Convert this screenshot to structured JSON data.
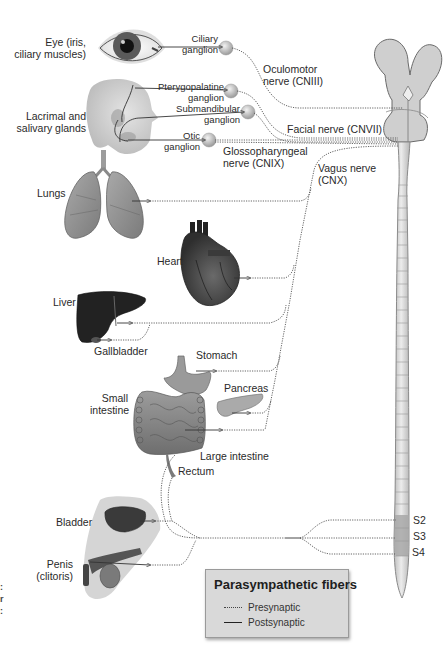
{
  "title": "Parasympathetic fibers",
  "legend": {
    "title": "Parasympathetic fibers",
    "items": [
      {
        "style": "dotted",
        "label": "Presynaptic"
      },
      {
        "style": "solid",
        "label": "Postsynaptic"
      }
    ]
  },
  "organs": {
    "eye": "Eye (iris,\nciliary muscles)",
    "eye_l1": "Eye (iris,",
    "eye_l2": "ciliary muscles)",
    "glands_l1": "Lacrimal and",
    "glands_l2": "salivary glands",
    "lungs": "Lungs",
    "heart": "Heart",
    "liver": "Liver",
    "gallbladder": "Gallbladder",
    "stomach": "Stomach",
    "pancreas": "Pancreas",
    "small_intestine_l1": "Small",
    "small_intestine_l2": "intestine",
    "large_intestine": "Large intestine",
    "rectum": "Rectum",
    "bladder": "Bladder",
    "penis_l1": "Penis",
    "penis_l2": "(clitoris)"
  },
  "ganglia": {
    "ciliary_l1": "Ciliary",
    "ciliary_l2": "ganglion",
    "pterygopalatine_l1": "Pterygopalatine",
    "pterygopalatine_l2": "ganglion",
    "submandibular_l1": "Submandibular",
    "submandibular_l2": "ganglion",
    "otic_l1": "Otic",
    "otic_l2": "ganglion"
  },
  "nerves": {
    "oculomotor_l1": "Oculomotor",
    "oculomotor_l2": "nerve (CNIII)",
    "facial": "Facial nerve (CNVII)",
    "glosso_l1": "Glossopharyngeal",
    "glosso_l2": "nerve (CNIX)",
    "vagus_l1": "Vagus nerve",
    "vagus_l2": "(CNX)"
  },
  "spinal_segments": [
    "S2",
    "S3",
    "S4"
  ],
  "edge_marks": [
    ":",
    "r",
    ":"
  ],
  "colors": {
    "background": "#ffffff",
    "legend_bg": "#d9d9d9",
    "organ_gray": "#8c8c8c",
    "dark_organ": "#2b2b2b",
    "cord": "#dcdcdc",
    "sacral_band": "#a8a8a8",
    "fiber": "#555555"
  }
}
